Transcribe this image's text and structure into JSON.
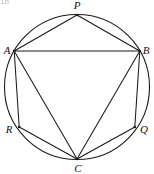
{
  "figure": {
    "corner_text": "1b",
    "background_color": "#ffffff",
    "stroke_color": "#1a1a1a",
    "label_color": "#111111",
    "canvas": {
      "width": 154,
      "height": 174
    },
    "circle": {
      "name": "circumcircle",
      "cx": 77,
      "cy": 87,
      "r": 72.5,
      "stroke_width": 1.1
    },
    "points": [
      {
        "id": "P",
        "label": "P",
        "x": 77,
        "y": 15,
        "label_x": 77,
        "label_y": 9,
        "label_anchor": "middle"
      },
      {
        "id": "B",
        "label": "B",
        "x": 139.8,
        "y": 51.0,
        "label_x": 146,
        "label_y": 54,
        "label_anchor": "middle"
      },
      {
        "id": "Q",
        "label": "Q",
        "x": 134.8,
        "y": 127.0,
        "label_x": 144,
        "label_y": 133,
        "label_anchor": "middle"
      },
      {
        "id": "C",
        "label": "C",
        "x": 77,
        "y": 159.0,
        "label_x": 78,
        "label_y": 172,
        "label_anchor": "middle"
      },
      {
        "id": "R",
        "label": "R",
        "x": 19.2,
        "y": 127.0,
        "label_x": 9,
        "label_y": 133,
        "label_anchor": "middle"
      },
      {
        "id": "A",
        "label": "A",
        "x": 14.2,
        "y": 51.0,
        "label_x": 7,
        "label_y": 54,
        "label_anchor": "middle"
      }
    ],
    "chords": [
      {
        "name": "chord-A-P",
        "from": "A",
        "to": "P"
      },
      {
        "name": "chord-P-B",
        "from": "P",
        "to": "B"
      },
      {
        "name": "chord-A-B",
        "from": "A",
        "to": "B"
      },
      {
        "name": "chord-B-Q",
        "from": "B",
        "to": "Q"
      },
      {
        "name": "chord-Q-C",
        "from": "Q",
        "to": "C"
      },
      {
        "name": "chord-C-R",
        "from": "C",
        "to": "R"
      },
      {
        "name": "chord-R-A",
        "from": "R",
        "to": "A"
      },
      {
        "name": "chord-A-C",
        "from": "A",
        "to": "C"
      },
      {
        "name": "chord-B-C",
        "from": "B",
        "to": "C"
      }
    ]
  }
}
